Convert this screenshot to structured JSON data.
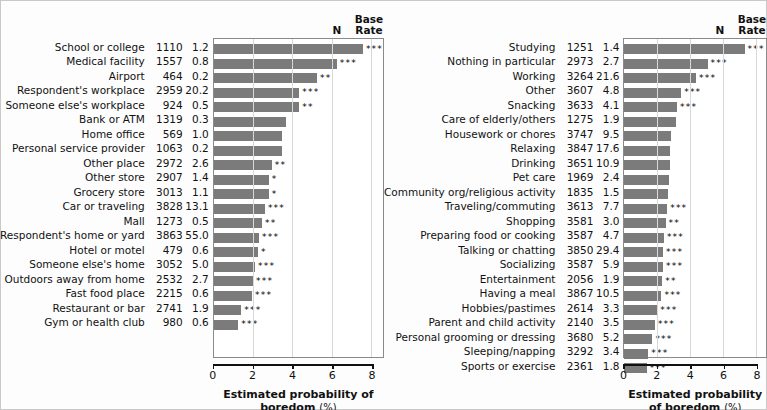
{
  "headers": {
    "n_label": "N",
    "base_rate_line1": "Base",
    "base_rate_line2": "Rate"
  },
  "axis": {
    "title_main": "Estimated probability of boredom",
    "title_unit": "(%)",
    "ticks": [
      "0",
      "2",
      "4",
      "6",
      "8"
    ],
    "min": 0,
    "max": 8.6
  },
  "style": {
    "bar_color": "#7b7b7b",
    "grid_color": "#d8d8d8",
    "axis_color": "#111111"
  },
  "chart_data": {
    "type": "bar",
    "title": "",
    "xlabel": "Estimated probability of boredom (%)",
    "ylabel": "",
    "xlim": [
      0,
      8.6
    ],
    "grid": true,
    "orientation": "horizontal",
    "panels": [
      {
        "name": "Location",
        "columns": [
          "N",
          "Base Rate",
          "Estimated probability of boredom (%)"
        ],
        "rows": [
          {
            "label": "School or college",
            "n": "1110",
            "base_rate": "1.2",
            "value": 7.85,
            "sig": "***"
          },
          {
            "label": "Medical facility",
            "n": "1557",
            "base_rate": "0.8",
            "value": 6.25,
            "sig": "***"
          },
          {
            "label": "Airport",
            "n": "464",
            "base_rate": "0.2",
            "value": 5.25,
            "sig": "**"
          },
          {
            "label": "Respondent's workplace",
            "n": "2959",
            "base_rate": "20.2",
            "value": 4.35,
            "sig": "***"
          },
          {
            "label": "Someone else's workplace",
            "n": "924",
            "base_rate": "0.5",
            "value": 4.35,
            "sig": "**"
          },
          {
            "label": "Bank or ATM",
            "n": "1319",
            "base_rate": "0.3",
            "value": 3.65,
            "sig": ""
          },
          {
            "label": "Home office",
            "n": "569",
            "base_rate": "1.0",
            "value": 3.45,
            "sig": ""
          },
          {
            "label": "Personal service provider",
            "n": "1063",
            "base_rate": "0.2",
            "value": 3.45,
            "sig": ""
          },
          {
            "label": "Other place",
            "n": "2972",
            "base_rate": "2.6",
            "value": 2.95,
            "sig": "**"
          },
          {
            "label": "Other store",
            "n": "2907",
            "base_rate": "1.4",
            "value": 2.8,
            "sig": "*"
          },
          {
            "label": "Grocery store",
            "n": "3013",
            "base_rate": "1.1",
            "value": 2.8,
            "sig": "*"
          },
          {
            "label": "Car or traveling",
            "n": "3828",
            "base_rate": "13.1",
            "value": 2.6,
            "sig": "***"
          },
          {
            "label": "Mall",
            "n": "1273",
            "base_rate": "0.5",
            "value": 2.45,
            "sig": "**"
          },
          {
            "label": "Respondent's home or yard",
            "n": "3863",
            "base_rate": "55.0",
            "value": 2.3,
            "sig": "***"
          },
          {
            "label": "Hotel or motel",
            "n": "479",
            "base_rate": "0.6",
            "value": 2.25,
            "sig": "*"
          },
          {
            "label": "Someone else's home",
            "n": "3052",
            "base_rate": "5.0",
            "value": 2.1,
            "sig": "***"
          },
          {
            "label": "Outdoors away from home",
            "n": "2532",
            "base_rate": "2.7",
            "value": 2.0,
            "sig": "***"
          },
          {
            "label": "Fast food place",
            "n": "2215",
            "base_rate": "0.6",
            "value": 1.95,
            "sig": "***"
          },
          {
            "label": "Restaurant or bar",
            "n": "2741",
            "base_rate": "1.9",
            "value": 1.4,
            "sig": "***"
          },
          {
            "label": "Gym or health club",
            "n": "980",
            "base_rate": "0.6",
            "value": 1.25,
            "sig": "***"
          }
        ]
      },
      {
        "name": "Activity",
        "columns": [
          "N",
          "Base Rate",
          "Estimated probability of boredom (%)"
        ],
        "rows": [
          {
            "label": "Studying",
            "n": "1251",
            "base_rate": "1.4",
            "value": 7.3,
            "sig": "***"
          },
          {
            "label": "Nothing in particular",
            "n": "2973",
            "base_rate": "2.7",
            "value": 5.05,
            "sig": "***"
          },
          {
            "label": "Working",
            "n": "3264",
            "base_rate": "21.6",
            "value": 4.35,
            "sig": "***"
          },
          {
            "label": "Other",
            "n": "3607",
            "base_rate": "4.8",
            "value": 3.45,
            "sig": "***"
          },
          {
            "label": "Snacking",
            "n": "3633",
            "base_rate": "4.1",
            "value": 3.2,
            "sig": "***"
          },
          {
            "label": "Care of elderly/others",
            "n": "1275",
            "base_rate": "1.9",
            "value": 3.15,
            "sig": ""
          },
          {
            "label": "Housework or chores",
            "n": "3747",
            "base_rate": "9.5",
            "value": 2.8,
            "sig": ""
          },
          {
            "label": "Relaxing",
            "n": "3847",
            "base_rate": "17.6",
            "value": 2.75,
            "sig": ""
          },
          {
            "label": "Drinking",
            "n": "3651",
            "base_rate": "10.9",
            "value": 2.75,
            "sig": ""
          },
          {
            "label": "Pet care",
            "n": "1969",
            "base_rate": "2.4",
            "value": 2.7,
            "sig": ""
          },
          {
            "label": "Community org/religious activity",
            "n": "1835",
            "base_rate": "1.5",
            "value": 2.65,
            "sig": ""
          },
          {
            "label": "Traveling/commuting",
            "n": "3613",
            "base_rate": "7.7",
            "value": 2.6,
            "sig": "***"
          },
          {
            "label": "Shopping",
            "n": "3581",
            "base_rate": "3.0",
            "value": 2.5,
            "sig": "**"
          },
          {
            "label": "Preparing food or cooking",
            "n": "3587",
            "base_rate": "4.7",
            "value": 2.4,
            "sig": "***"
          },
          {
            "label": "Talking or chatting",
            "n": "3850",
            "base_rate": "29.4",
            "value": 2.35,
            "sig": "***"
          },
          {
            "label": "Socializing",
            "n": "3587",
            "base_rate": "5.9",
            "value": 2.35,
            "sig": "***"
          },
          {
            "label": "Entertainment",
            "n": "2056",
            "base_rate": "1.9",
            "value": 2.3,
            "sig": "**"
          },
          {
            "label": "Having a meal",
            "n": "3867",
            "base_rate": "10.5",
            "value": 2.25,
            "sig": "***"
          },
          {
            "label": "Hobbies/pastimes",
            "n": "2614",
            "base_rate": "3.3",
            "value": 2.0,
            "sig": "***"
          },
          {
            "label": "Parent and child activity",
            "n": "2140",
            "base_rate": "3.5",
            "value": 1.85,
            "sig": "***"
          },
          {
            "label": "Personal grooming or dressing",
            "n": "3680",
            "base_rate": "5.2",
            "value": 1.7,
            "sig": "***"
          },
          {
            "label": "Sleeping/napping",
            "n": "3292",
            "base_rate": "3.4",
            "value": 1.45,
            "sig": "***"
          },
          {
            "label": "Sports or exercise",
            "n": "2361",
            "base_rate": "1.8",
            "value": 1.35,
            "sig": "***"
          }
        ]
      }
    ]
  }
}
